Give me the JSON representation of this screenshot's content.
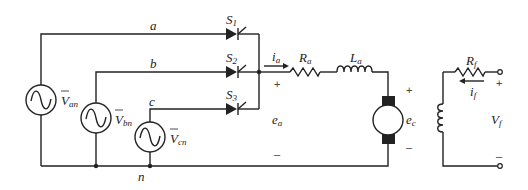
{
  "diagram": {
    "sources": [
      {
        "name": "V",
        "sub": "an",
        "overline": true
      },
      {
        "name": "V",
        "sub": "bn",
        "overline": true
      },
      {
        "name": "V",
        "sub": "cn",
        "overline": true
      }
    ],
    "phase_labels": [
      "a",
      "b",
      "c"
    ],
    "neutral_label": "n",
    "switches": [
      {
        "name": "S",
        "sub": "1"
      },
      {
        "name": "S",
        "sub": "2"
      },
      {
        "name": "S",
        "sub": "3"
      }
    ],
    "armature": {
      "current": {
        "name": "i",
        "sub": "a"
      },
      "resistor": {
        "name": "R",
        "sub": "a"
      },
      "inductor": {
        "name": "L",
        "sub": "a"
      },
      "voltage": {
        "name": "e",
        "sub": "a"
      },
      "plus": "+",
      "minus": "–"
    },
    "motor": {
      "emf": {
        "name": "e",
        "sub": "c"
      },
      "plus": "+",
      "minus": "–"
    },
    "field": {
      "resistor": {
        "name": "R",
        "sub": "f"
      },
      "current": {
        "name": "i",
        "sub": "f"
      },
      "voltage": {
        "name": "V",
        "sub": "f"
      },
      "plus": "+",
      "minus": "–"
    }
  }
}
